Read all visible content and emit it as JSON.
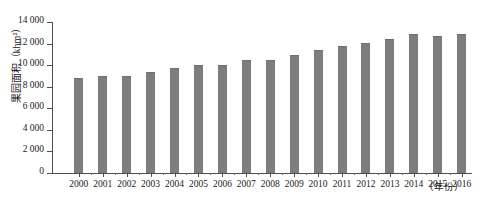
{
  "chart_data": {
    "type": "bar",
    "title": "",
    "subtitle": "",
    "xlabel": "（年份）",
    "ylabel": "果园面积（khm²）",
    "ylim": [
      0,
      14000
    ],
    "ytick_step": 2000,
    "grid": false,
    "legend": null,
    "bar_color": "#7d7d7d",
    "axis_color": "#4d4d4d",
    "categories": [
      "2000",
      "2001",
      "2002",
      "2003",
      "2004",
      "2005",
      "2006",
      "2007",
      "2008",
      "2009",
      "2010",
      "2011",
      "2012",
      "2013",
      "2014",
      "2015",
      "2016"
    ],
    "values": [
      8800,
      8950,
      9000,
      9350,
      9700,
      10000,
      10050,
      10450,
      10500,
      10950,
      11450,
      11750,
      12100,
      12400,
      12900,
      12700,
      12900
    ],
    "ytick_labels": [
      "0",
      "2 000",
      "4 000",
      "6 000",
      "8 000",
      "10 000",
      "12 000",
      "14 000"
    ],
    "ytick_values": [
      0,
      2000,
      4000,
      6000,
      8000,
      10000,
      12000,
      14000
    ]
  }
}
